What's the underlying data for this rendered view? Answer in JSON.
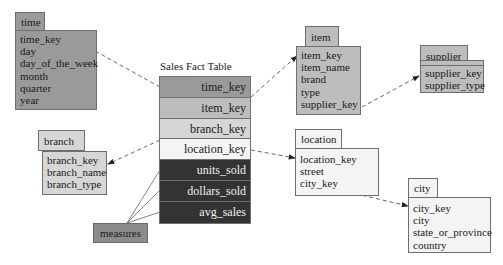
{
  "colors": {
    "dark_gray": "#9a9a9a",
    "medium_gray": "#bdbdbd",
    "light_gray": "#d6d6d6",
    "very_light": "#f4f4f4",
    "black_measure": "#333333",
    "measures_box": "#8c8c8c"
  },
  "fact_table": {
    "title": "Sales Fact Table",
    "rows": [
      {
        "label": "time_key",
        "kind": "key"
      },
      {
        "label": "item_key",
        "kind": "key"
      },
      {
        "label": "branch_key",
        "kind": "key"
      },
      {
        "label": "location_key",
        "kind": "key"
      },
      {
        "label": "units_sold",
        "kind": "measure"
      },
      {
        "label": "dollars_sold",
        "kind": "measure"
      },
      {
        "label": "avg_sales",
        "kind": "measure"
      }
    ]
  },
  "measures_label": "measures",
  "dimensions": {
    "time": {
      "name": "time",
      "attributes": [
        "time_key",
        "day",
        "day_of_the_week",
        "month",
        "quarter",
        "year"
      ]
    },
    "item": {
      "name": "item",
      "attributes": [
        "item_key",
        "item_name",
        "brand",
        "type",
        "supplier_key"
      ]
    },
    "supplier": {
      "name": "supplier",
      "attributes": [
        "supplier_key",
        "supplier_type"
      ]
    },
    "branch": {
      "name": "branch",
      "attributes": [
        "branch_key",
        "branch_name",
        "branch_type"
      ]
    },
    "location": {
      "name": "location",
      "attributes": [
        "location_key",
        "street",
        "city_key"
      ]
    },
    "city": {
      "name": "city",
      "attributes": [
        "city_key",
        "city",
        "state_or_province",
        "country"
      ]
    }
  },
  "relationships": [
    {
      "from": "fact.time_key",
      "to": "time.time_key"
    },
    {
      "from": "fact.item_key",
      "to": "item.item_key"
    },
    {
      "from": "fact.branch_key",
      "to": "branch.branch_key"
    },
    {
      "from": "fact.location_key",
      "to": "location.location_key"
    },
    {
      "from": "item.supplier_key",
      "to": "supplier.supplier_key"
    },
    {
      "from": "location.city_key",
      "to": "city.city_key"
    },
    {
      "from": "measures",
      "to": "fact.units_sold"
    },
    {
      "from": "measures",
      "to": "fact.dollars_sold"
    },
    {
      "from": "measures",
      "to": "fact.avg_sales"
    }
  ]
}
